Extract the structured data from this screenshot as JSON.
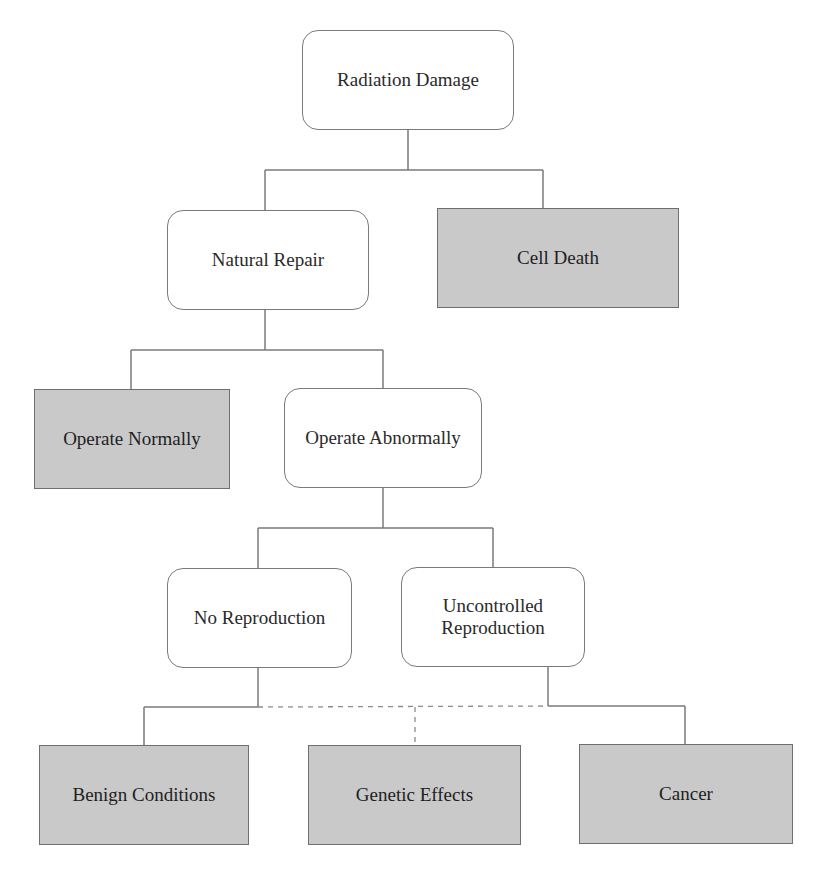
{
  "diagram": {
    "type": "flowchart-tree",
    "colors": {
      "outcome_fill": "#c9c9c9",
      "process_fill": "#ffffff",
      "line": "#7a7a7a"
    },
    "nodes": {
      "radiation_damage": {
        "label": "Radiation Damage",
        "kind": "process"
      },
      "natural_repair": {
        "label": "Natural Repair",
        "kind": "process"
      },
      "cell_death": {
        "label": "Cell Death",
        "kind": "outcome"
      },
      "operate_normally": {
        "label": "Operate Normally",
        "kind": "outcome"
      },
      "operate_abnormally": {
        "label": "Operate Abnormally",
        "kind": "process"
      },
      "no_reproduction": {
        "label": "No Reproduction",
        "kind": "process"
      },
      "uncontrolled_reproduction": {
        "label": "Uncontrolled Reproduction",
        "kind": "process"
      },
      "benign_conditions": {
        "label": "Benign Conditions",
        "kind": "outcome"
      },
      "genetic_effects": {
        "label": "Genetic Effects",
        "kind": "outcome"
      },
      "cancer": {
        "label": "Cancer",
        "kind": "outcome"
      }
    },
    "edges": [
      {
        "from": "radiation_damage",
        "to": "natural_repair",
        "style": "solid"
      },
      {
        "from": "radiation_damage",
        "to": "cell_death",
        "style": "solid"
      },
      {
        "from": "natural_repair",
        "to": "operate_normally",
        "style": "solid"
      },
      {
        "from": "natural_repair",
        "to": "operate_abnormally",
        "style": "solid"
      },
      {
        "from": "operate_abnormally",
        "to": "no_reproduction",
        "style": "solid"
      },
      {
        "from": "operate_abnormally",
        "to": "uncontrolled_reproduction",
        "style": "solid"
      },
      {
        "from": "no_reproduction",
        "to": "benign_conditions",
        "style": "solid"
      },
      {
        "from": "no_reproduction",
        "to": "genetic_effects",
        "style": "dashed"
      },
      {
        "from": "uncontrolled_reproduction",
        "to": "genetic_effects",
        "style": "dashed"
      },
      {
        "from": "uncontrolled_reproduction",
        "to": "cancer",
        "style": "solid"
      }
    ]
  }
}
